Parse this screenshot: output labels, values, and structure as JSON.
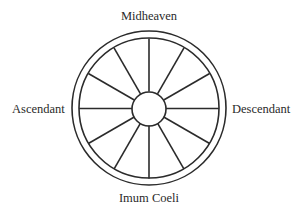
{
  "diagram": {
    "type": "astrological-house-wheel",
    "houses": 12,
    "colors": {
      "line": "#2b2b2b",
      "text": "#2a2a2a",
      "background": "#ffffff"
    },
    "labels": {
      "top": "Midheaven",
      "bottom": "Imum Coeli",
      "left": "Ascendant",
      "right": "Descendant"
    }
  }
}
